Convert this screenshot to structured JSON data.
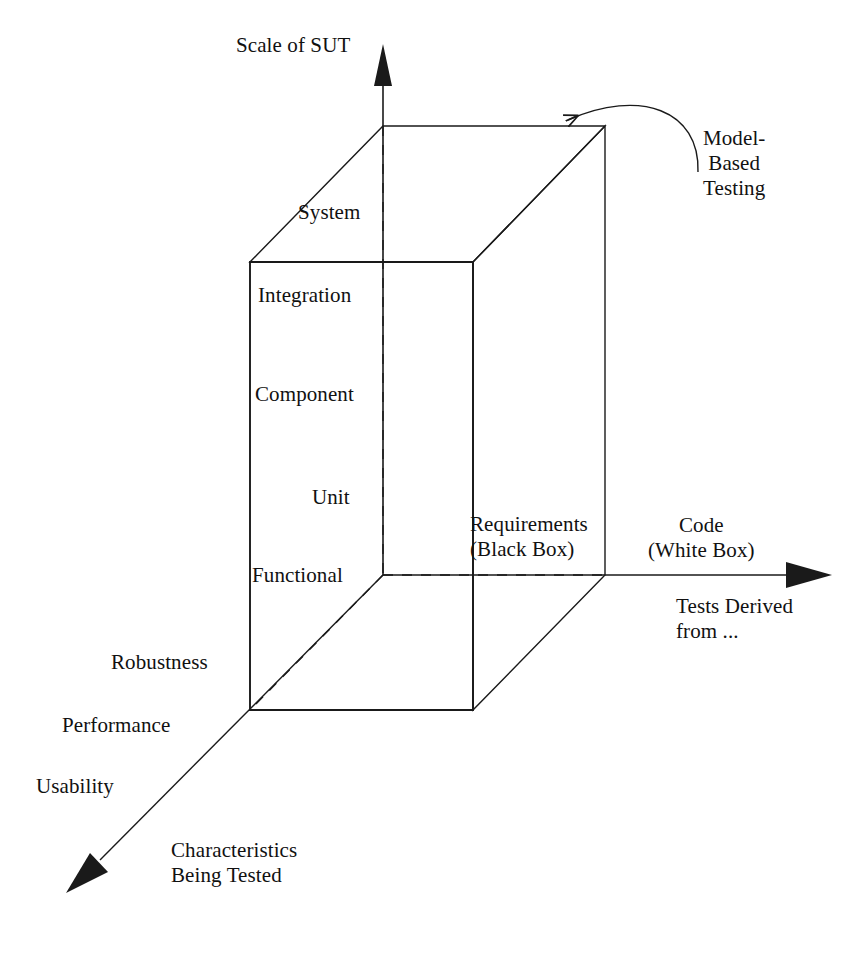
{
  "diagram": {
    "type": "3d-axes-cube-taxonomy",
    "axes": {
      "vertical": {
        "title": "Scale of SUT",
        "levels": [
          "System",
          "Integration",
          "Component",
          "Unit",
          "Functional"
        ]
      },
      "horizontal": {
        "title": "Code\n(White Box)",
        "sub_title": "Tests Derived\nfrom ...",
        "inner_label": "Requirements\n(Black Box)"
      },
      "depth": {
        "title": "Characteristics\nBeing Tested",
        "levels": [
          "Robustness",
          "Performance",
          "Usability"
        ]
      }
    },
    "annotations": [
      {
        "id": "model-based-testing",
        "text": "Model-\nBased\nTesting",
        "points_to": "cube-top-back-right-corner"
      }
    ],
    "colors": {
      "stroke": "#1a1a1a",
      "background": "#ffffff",
      "text": "#111111"
    }
  }
}
